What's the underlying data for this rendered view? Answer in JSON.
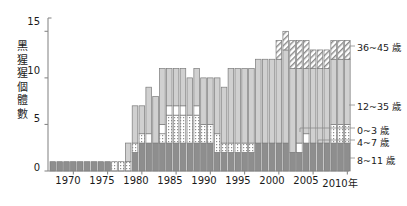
{
  "chart_data": {
    "type": "bar",
    "stacked": true,
    "title": "",
    "xlabel": "",
    "ylabel": "黑猩猩個體數",
    "ylim": [
      0,
      16
    ],
    "yticks": [
      0,
      5,
      10,
      15
    ],
    "ytick_labels": [
      "0",
      "5",
      "10",
      "15"
    ],
    "xticks": [
      1970,
      1975,
      1980,
      1985,
      1990,
      1995,
      2000,
      2005,
      2010
    ],
    "xtick_labels": [
      "1970",
      "1975",
      "1980",
      "1985",
      "1990",
      "1995",
      "2000",
      "2005",
      "2010年"
    ],
    "grid": false,
    "legend_position": "right",
    "series": [
      {
        "name": "0~3 歲",
        "key": "a0_3",
        "fill": "white",
        "values": [
          0,
          0,
          0,
          0,
          0,
          0,
          0,
          0,
          0,
          0,
          0,
          0,
          0,
          0,
          1,
          0,
          1,
          1,
          1,
          1,
          0,
          1,
          0,
          0,
          0,
          0,
          0,
          0,
          0,
          0,
          0,
          0,
          0,
          0,
          0,
          0,
          1,
          1,
          0,
          0,
          0,
          0,
          0,
          0
        ]
      },
      {
        "name": "4~7 歲",
        "key": "a4_7",
        "fill": "midgray",
        "values": [
          1,
          1,
          1,
          1,
          1,
          1,
          1,
          1,
          1,
          0,
          0,
          0,
          2,
          3,
          3,
          3,
          3,
          3,
          3,
          3,
          3,
          3,
          3,
          3,
          2,
          2,
          2,
          2,
          2,
          2,
          3,
          3,
          3,
          3,
          3,
          2,
          2,
          3,
          3,
          3,
          3,
          3,
          3,
          3
        ]
      },
      {
        "name": "8~11 歲",
        "key": "a8_11",
        "fill": "dotted",
        "values": [
          0,
          0,
          0,
          0,
          0,
          0,
          0,
          0,
          0,
          1,
          1,
          1,
          1,
          1,
          0,
          0,
          1,
          3,
          3,
          3,
          3,
          3,
          2,
          2,
          2,
          1,
          1,
          1,
          1,
          1,
          0,
          0,
          0,
          0,
          0,
          0,
          0,
          0,
          0,
          0,
          0,
          2,
          2,
          2
        ]
      },
      {
        "name": "12~35 歲",
        "key": "a12_35",
        "fill": "lightgray",
        "values": [
          0,
          0,
          0,
          0,
          0,
          0,
          0,
          0,
          0,
          0,
          0,
          2,
          4,
          3,
          5,
          5,
          6,
          4,
          4,
          4,
          4,
          4,
          5,
          5,
          6,
          6,
          8,
          8,
          8,
          8,
          9,
          9,
          9,
          9,
          10,
          9,
          8,
          7,
          8,
          8,
          8,
          7,
          7,
          7
        ]
      },
      {
        "name": "36~45 歲",
        "key": "a36_45",
        "fill": "hatched",
        "values": [
          0,
          0,
          0,
          0,
          0,
          0,
          0,
          0,
          0,
          0,
          0,
          0,
          0,
          0,
          0,
          0,
          0,
          0,
          0,
          0,
          0,
          0,
          0,
          0,
          0,
          0,
          0,
          0,
          0,
          0,
          0,
          0,
          0,
          2,
          2,
          3,
          3,
          3,
          2,
          2,
          2,
          2,
          2,
          2
        ]
      }
    ],
    "years": [
      1967,
      1968,
      1969,
      1970,
      1971,
      1972,
      1973,
      1974,
      1975,
      1976,
      1977,
      1978,
      1979,
      1980,
      1981,
      1982,
      1983,
      1984,
      1985,
      1986,
      1987,
      1988,
      1989,
      1990,
      1991,
      1992,
      1993,
      1994,
      1995,
      1996,
      1997,
      1998,
      1999,
      2000,
      2001,
      2002,
      2003,
      2004,
      2005,
      2006,
      2007,
      2008,
      2009,
      2010
    ],
    "totals": [
      1,
      1,
      1,
      1,
      1,
      1,
      1,
      1,
      1,
      1,
      1,
      3,
      7,
      7,
      9,
      8,
      11,
      11,
      11,
      11,
      10,
      11,
      10,
      10,
      10,
      9,
      11,
      11,
      11,
      11,
      12,
      12,
      12,
      14,
      15,
      14,
      14,
      14,
      13,
      13,
      13,
      14,
      14,
      14
    ],
    "colors": {
      "axis": "#8a8a8a",
      "text": "#1a1a1a",
      "bar_stroke": "#7a7a7a",
      "light_gray": "#d0d0d0",
      "mid_gray": "#8e8e8e",
      "dotted_bg": "#ffffff",
      "dot_color": "#9a9a9a",
      "hatch_color": "#8a8a8a",
      "white": "#ffffff"
    }
  },
  "legend": {
    "items": [
      {
        "label": "36~45 歲",
        "key": "a36_45"
      },
      {
        "label": "12~35 歲",
        "key": "a12_35"
      },
      {
        "label": "0~3 歲",
        "key": "a0_3"
      },
      {
        "label": "4~7 歲",
        "key": "a4_7"
      },
      {
        "label": "8~11 歲",
        "key": "a8_11"
      }
    ]
  },
  "axis": {
    "y_label_chars": [
      "黑",
      "猩",
      "猩",
      "個",
      "體",
      "數"
    ],
    "y_tick_0": "0",
    "y_tick_5": "5",
    "y_tick_10": "10",
    "y_tick_15": "15",
    "x_tick_1970": "1970",
    "x_tick_1975": "1975",
    "x_tick_1980": "1980",
    "x_tick_1985": "1985",
    "x_tick_1990": "1990",
    "x_tick_1995": "1995",
    "x_tick_2000": "2000",
    "x_tick_2005": "2005",
    "x_tick_2010": "2010年"
  }
}
